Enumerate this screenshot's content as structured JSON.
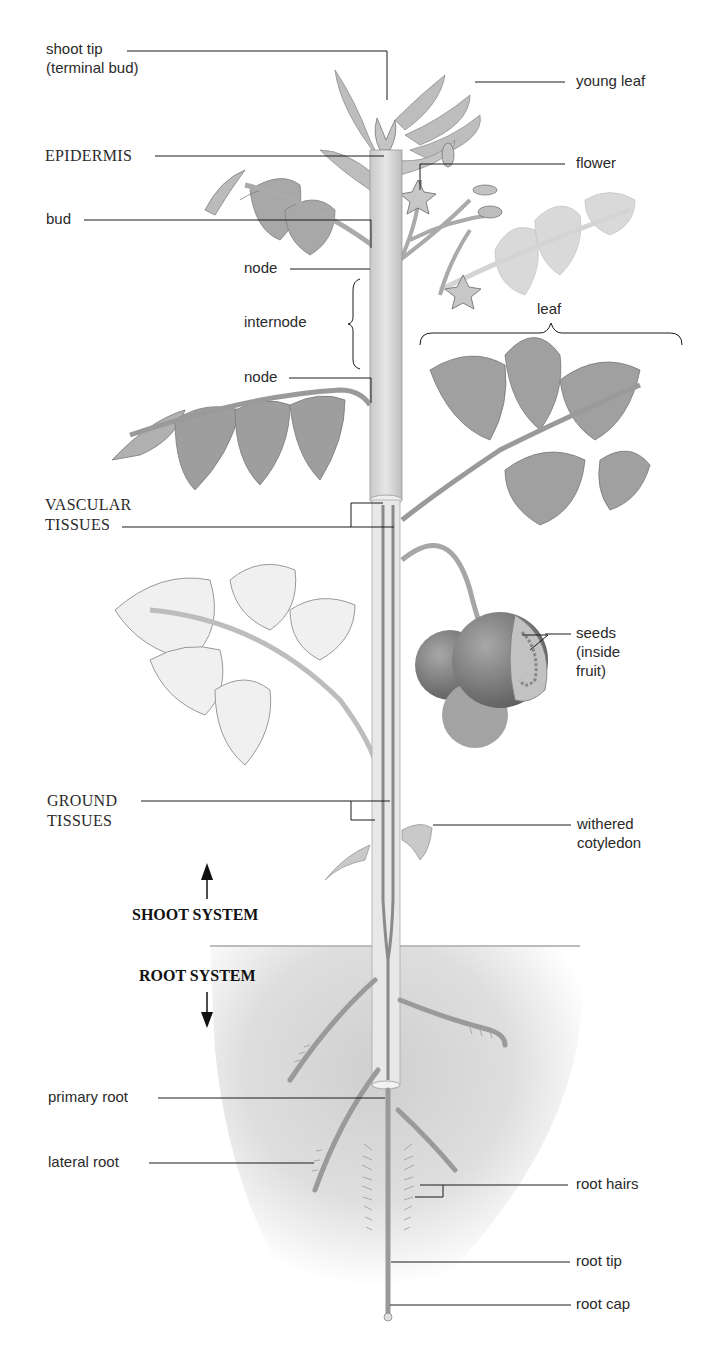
{
  "diagram": {
    "background_color": "#ffffff",
    "soil_color": "#d9d9d9",
    "plant_color": "#b8b8b8",
    "line_color": "#1a1a1a"
  },
  "labels": {
    "shoot_tip": {
      "line1": "shoot tip",
      "line2": "(terminal bud)"
    },
    "young_leaf": "young leaf",
    "epidermis": "EPIDERMIS",
    "flower": "flower",
    "bud": "bud",
    "node_upper": "node",
    "internode": "internode",
    "leaf": "leaf",
    "node_lower": "node",
    "vascular_tissues": {
      "line1": "VASCULAR",
      "line2": "TISSUES"
    },
    "seeds": {
      "line1": "seeds",
      "line2": "(inside",
      "line3": "fruit)"
    },
    "ground_tissues": {
      "line1": "GROUND",
      "line2": "TISSUES"
    },
    "withered_cotyledon": {
      "line1": "withered",
      "line2": "cotyledon"
    },
    "shoot_system": "SHOOT SYSTEM",
    "root_system": "ROOT SYSTEM",
    "primary_root": "primary root",
    "lateral_root": "lateral root",
    "root_hairs": "root hairs",
    "root_tip": "root tip",
    "root_cap": "root cap"
  },
  "icons": {
    "shoot_arrow": "arrow-up",
    "root_arrow": "arrow-down"
  }
}
